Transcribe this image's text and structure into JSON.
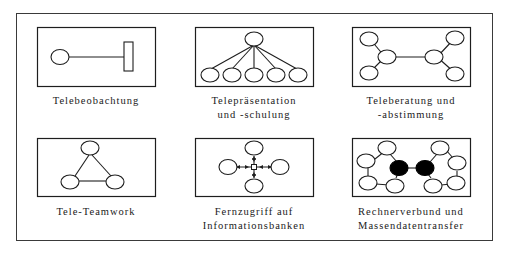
{
  "figure": {
    "panels": [
      {
        "id": "telebeobachtung",
        "caption_lines": [
          "Telebeobachtung"
        ]
      },
      {
        "id": "telepraesentation",
        "caption_lines": [
          "Telepräsentation",
          "und -schulung"
        ]
      },
      {
        "id": "teleberatung",
        "caption_lines": [
          "Teleberatung und",
          "-abstimmung"
        ]
      },
      {
        "id": "tele-teamwork",
        "caption_lines": [
          "Tele-Teamwork"
        ]
      },
      {
        "id": "fernzugriff",
        "caption_lines": [
          "Fernzugriff auf",
          "Informationsbanken"
        ]
      },
      {
        "id": "rechnerverbund",
        "caption_lines": [
          "Rechnerverbund und",
          "Massendatentransfer"
        ]
      }
    ],
    "colors": {
      "line": "#1e1e1e",
      "filled_node": "#000000",
      "background": "#ffffff"
    }
  }
}
